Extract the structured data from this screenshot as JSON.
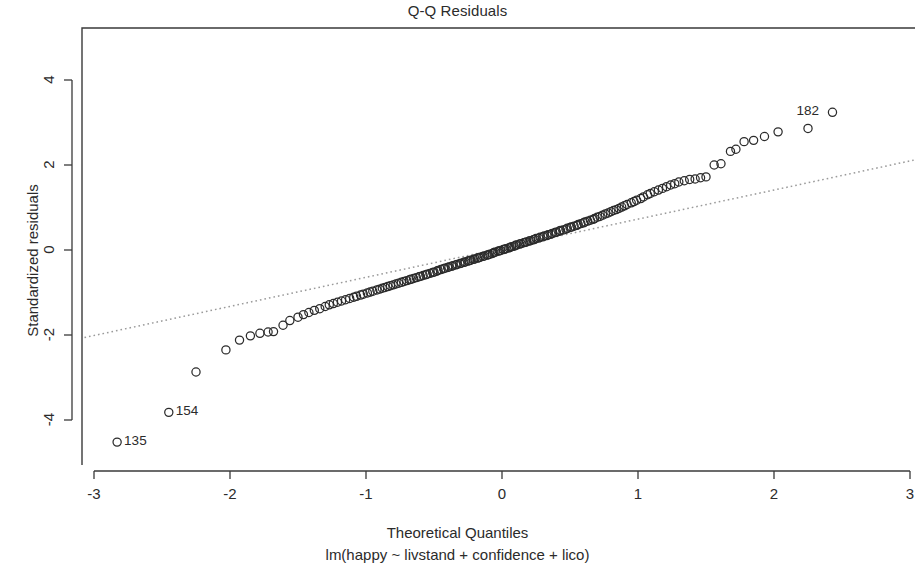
{
  "chart_data": {
    "type": "scatter",
    "title": "Q-Q Residuals",
    "xlabel": "Theoretical Quantiles",
    "sublabel": "lm(happy ~ livstand + confidence + lico)",
    "ylabel": "Standardized residuals",
    "xlim": [
      -3.07,
      3.05
    ],
    "ylim": [
      -5.2,
      4.9
    ],
    "xticks": [
      -3,
      -2,
      -1,
      0,
      1,
      2,
      3
    ],
    "xtick_labels": [
      "-3",
      "-2",
      "-1",
      "0",
      "1",
      "2",
      "3"
    ],
    "yticks": [
      4,
      2,
      0,
      -2,
      -4
    ],
    "ytick_labels": [
      "4",
      "2",
      "0",
      "-2",
      "-4"
    ],
    "grid": false,
    "legend": false,
    "point_marker": "open-circle",
    "point_color": "#2b2b2b",
    "reference_line": {
      "style": "dotted",
      "color": "#9a9a9a",
      "x": [
        -3.07,
        3.05
      ],
      "y": [
        -2.06,
        2.13
      ]
    },
    "annotations": [
      {
        "label": "182",
        "x": 2.43,
        "y": 3.24,
        "text_side": "left"
      },
      {
        "label": "154",
        "x": -2.45,
        "y": -3.82,
        "text_side": "right"
      },
      {
        "label": "135",
        "x": -2.83,
        "y": -4.52,
        "text_side": "right"
      }
    ],
    "x": [
      -2.83,
      -2.45,
      -2.25,
      -2.03,
      -1.93,
      -1.85,
      -1.78,
      -1.72,
      -1.68,
      -1.61,
      -1.56,
      -1.5,
      -1.46,
      -1.42,
      -1.38,
      -1.34,
      -1.3,
      -1.27,
      -1.24,
      -1.21,
      -1.18,
      -1.15,
      -1.12,
      -1.09,
      -1.07,
      -1.04,
      -1.02,
      -0.99,
      -0.97,
      -0.95,
      -0.92,
      -0.9,
      -0.88,
      -0.86,
      -0.84,
      -0.82,
      -0.8,
      -0.78,
      -0.76,
      -0.74,
      -0.72,
      -0.7,
      -0.68,
      -0.67,
      -0.65,
      -0.63,
      -0.61,
      -0.6,
      -0.58,
      -0.56,
      -0.55,
      -0.53,
      -0.51,
      -0.5,
      -0.48,
      -0.47,
      -0.45,
      -0.43,
      -0.42,
      -0.4,
      -0.39,
      -0.37,
      -0.36,
      -0.34,
      -0.33,
      -0.31,
      -0.3,
      -0.28,
      -0.27,
      -0.25,
      -0.24,
      -0.23,
      -0.21,
      -0.2,
      -0.18,
      -0.17,
      -0.16,
      -0.14,
      -0.13,
      -0.11,
      -0.1,
      -0.09,
      -0.07,
      -0.06,
      -0.05,
      -0.03,
      -0.02,
      -0.01,
      0.01,
      0.02,
      0.03,
      0.05,
      0.06,
      0.07,
      0.09,
      0.1,
      0.11,
      0.13,
      0.14,
      0.16,
      0.17,
      0.18,
      0.2,
      0.21,
      0.23,
      0.24,
      0.25,
      0.27,
      0.28,
      0.3,
      0.31,
      0.33,
      0.34,
      0.36,
      0.37,
      0.39,
      0.4,
      0.42,
      0.43,
      0.45,
      0.47,
      0.48,
      0.5,
      0.51,
      0.53,
      0.55,
      0.56,
      0.58,
      0.6,
      0.61,
      0.63,
      0.65,
      0.67,
      0.68,
      0.7,
      0.72,
      0.74,
      0.76,
      0.78,
      0.8,
      0.82,
      0.84,
      0.86,
      0.88,
      0.9,
      0.92,
      0.95,
      0.97,
      0.99,
      1.02,
      1.04,
      1.07,
      1.09,
      1.12,
      1.15,
      1.18,
      1.21,
      1.24,
      1.27,
      1.3,
      1.34,
      1.38,
      1.42,
      1.46,
      1.5,
      1.56,
      1.61,
      1.68,
      1.72,
      1.78,
      1.85,
      1.93,
      2.03,
      2.25,
      2.43
    ],
    "y": [
      -4.52,
      -3.82,
      -2.87,
      -2.35,
      -2.12,
      -2.02,
      -1.96,
      -1.93,
      -1.92,
      -1.77,
      -1.66,
      -1.58,
      -1.52,
      -1.47,
      -1.42,
      -1.38,
      -1.33,
      -1.29,
      -1.26,
      -1.23,
      -1.2,
      -1.17,
      -1.14,
      -1.11,
      -1.09,
      -1.06,
      -1.04,
      -1.01,
      -0.99,
      -0.97,
      -0.94,
      -0.92,
      -0.9,
      -0.88,
      -0.86,
      -0.84,
      -0.82,
      -0.8,
      -0.78,
      -0.76,
      -0.74,
      -0.72,
      -0.7,
      -0.69,
      -0.67,
      -0.65,
      -0.63,
      -0.62,
      -0.6,
      -0.58,
      -0.57,
      -0.55,
      -0.53,
      -0.52,
      -0.5,
      -0.48,
      -0.46,
      -0.44,
      -0.43,
      -0.41,
      -0.4,
      -0.38,
      -0.37,
      -0.35,
      -0.34,
      -0.32,
      -0.31,
      -0.29,
      -0.28,
      -0.26,
      -0.25,
      -0.24,
      -0.22,
      -0.21,
      -0.19,
      -0.18,
      -0.17,
      -0.15,
      -0.14,
      -0.12,
      -0.11,
      -0.1,
      -0.08,
      -0.06,
      -0.05,
      -0.03,
      -0.02,
      -0.01,
      0.01,
      0.02,
      0.03,
      0.05,
      0.06,
      0.08,
      0.09,
      0.11,
      0.12,
      0.14,
      0.15,
      0.17,
      0.18,
      0.19,
      0.21,
      0.22,
      0.24,
      0.25,
      0.27,
      0.28,
      0.3,
      0.31,
      0.33,
      0.34,
      0.36,
      0.37,
      0.39,
      0.41,
      0.42,
      0.44,
      0.46,
      0.47,
      0.49,
      0.51,
      0.53,
      0.54,
      0.56,
      0.58,
      0.6,
      0.62,
      0.64,
      0.66,
      0.68,
      0.7,
      0.72,
      0.74,
      0.77,
      0.79,
      0.82,
      0.85,
      0.87,
      0.9,
      0.93,
      0.95,
      0.98,
      1.01,
      1.04,
      1.07,
      1.11,
      1.14,
      1.17,
      1.21,
      1.25,
      1.3,
      1.33,
      1.37,
      1.41,
      1.45,
      1.49,
      1.53,
      1.56,
      1.6,
      1.63,
      1.66,
      1.67,
      1.7,
      1.72,
      2.0,
      2.03,
      2.32,
      2.37,
      2.55,
      2.58,
      2.67,
      2.78,
      2.86,
      3.24
    ]
  },
  "geometry": {
    "plot_left": 82,
    "plot_right": 915,
    "plot_top": 28,
    "plot_bottom": 465,
    "x0_px": 502,
    "x_unit_px": 136,
    "y0_px": 250,
    "y_unit_px": 42.5
  }
}
